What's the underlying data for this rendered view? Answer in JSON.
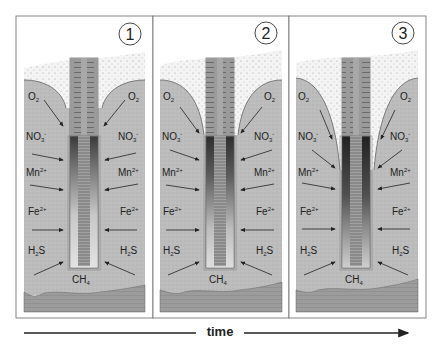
{
  "figure": {
    "type": "diagram",
    "panels": [
      {
        "number": "1",
        "labels_left": [
          "O2",
          "NO3-",
          "Mn2+",
          "Fe2+",
          "H2S"
        ],
        "labels_right": [
          "O2",
          "NO3-",
          "Mn2+",
          "Fe2+",
          "H2S"
        ],
        "bottom_label": "CH4",
        "aerobic_zone_depth": "shallow"
      },
      {
        "number": "2",
        "labels_left": [
          "O2",
          "NO3-",
          "Mn2+",
          "Fe2+",
          "H2S"
        ],
        "labels_right": [
          "O2",
          "NO3-",
          "Mn2+",
          "Fe2+",
          "H2S"
        ],
        "bottom_label": "CH4",
        "aerobic_zone_depth": "medium"
      },
      {
        "number": "3",
        "labels_left": [
          "O2",
          "NO3-",
          "Mn2+",
          "Fe2+",
          "H2S"
        ],
        "labels_right": [
          "O2",
          "NO3-",
          "Mn2+",
          "Fe2+",
          "H2S"
        ],
        "bottom_label": "CH4",
        "aerobic_zone_depth": "deep"
      }
    ],
    "species": {
      "o2": {
        "base": "O",
        "sub": "2",
        "sup": ""
      },
      "no3": {
        "base": "NO",
        "sub": "3",
        "sup": "-"
      },
      "mn": {
        "base": "Mn",
        "sub": "",
        "sup": "2+"
      },
      "fe": {
        "base": "Fe",
        "sub": "",
        "sup": "2+"
      },
      "h2s": {
        "base": "H",
        "sub": "2",
        "rest": "S"
      },
      "ch4": {
        "base": "CH",
        "sub": "4"
      }
    },
    "axis": {
      "label": "time",
      "direction": "left-to-right"
    },
    "colors": {
      "sediment_gray": "#b9b9b9",
      "unsaturated_zone": "#f3f3f3",
      "bedrock": "#9a9a9a",
      "well_casing": "#8c8c8c",
      "dark_zone": "#3a3a3a",
      "panel_border": "#555555"
    }
  }
}
